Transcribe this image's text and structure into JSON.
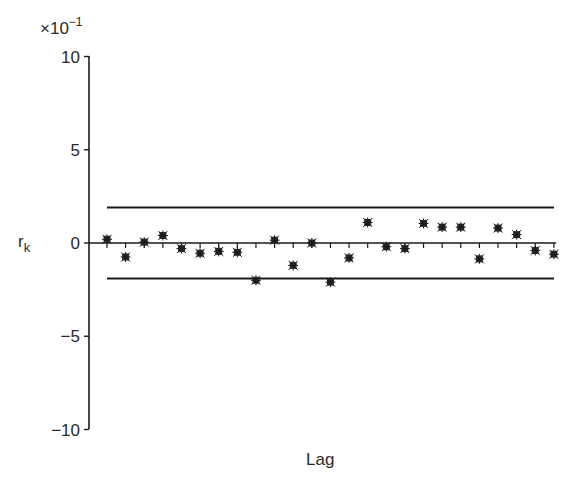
{
  "chart_data": {
    "type": "scatter",
    "title": "",
    "xlabel": "Lag",
    "ylabel": "r",
    "ylabel_subscript": "k",
    "y_multiplier": "×10",
    "y_multiplier_exp": "−1",
    "ylim": [
      -10,
      10
    ],
    "yticks": [
      10,
      5,
      0,
      -5,
      -10
    ],
    "ytick_labels": [
      "10",
      "5",
      "0",
      "−5",
      "−10"
    ],
    "grid": false,
    "confidence_band": {
      "upper": 1.9,
      "lower": -1.9
    },
    "x": [
      1,
      2,
      3,
      4,
      5,
      6,
      7,
      8,
      9,
      10,
      11,
      12,
      13,
      14,
      15,
      16,
      17,
      18,
      19,
      20,
      21,
      22,
      23,
      24,
      25
    ],
    "values": [
      0.2,
      -0.75,
      0.05,
      0.4,
      -0.3,
      -0.55,
      -0.45,
      -0.5,
      -2.0,
      0.15,
      -1.2,
      0.0,
      -2.1,
      -0.8,
      1.1,
      -0.2,
      -0.3,
      1.05,
      0.85,
      0.85,
      -0.85,
      0.8,
      0.45,
      -0.4,
      -0.6
    ],
    "marker": "asterisk",
    "colors": {
      "ink": "#1a1a1a",
      "background": "#ffffff"
    }
  }
}
